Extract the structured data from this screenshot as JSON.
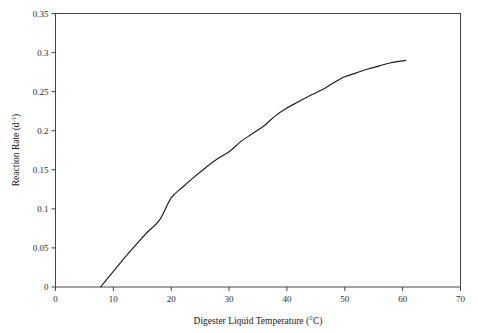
{
  "chart_data": {
    "type": "line",
    "title": "",
    "xlabel": "Digester Liquid Temperature (°C)",
    "ylabel": "Reaction Rate (d⁻¹)",
    "xlim": [
      0,
      70
    ],
    "ylim": [
      0,
      0.35
    ],
    "xticks": [
      0,
      10,
      20,
      30,
      40,
      50,
      60,
      70
    ],
    "xticklabels": [
      "0",
      "10",
      "20",
      "30",
      "40",
      "50",
      "60",
      "70"
    ],
    "yticks": [
      0,
      0.05,
      0.1,
      0.15,
      0.2,
      0.25,
      0.3,
      0.35
    ],
    "yticklabels": [
      "0",
      "0.05",
      "0.1",
      "0.15",
      "0.2",
      "0.25",
      "0.3",
      "0.35"
    ],
    "grid": false,
    "legend": false,
    "line_color": "#1d1d1d",
    "series": [
      {
        "name": "reaction-rate",
        "x": [
          7.8,
          9,
          10,
          12,
          14,
          16,
          18,
          20,
          22,
          24,
          26,
          28,
          30,
          32,
          34,
          36,
          38,
          40,
          42,
          44,
          46,
          48,
          50,
          52,
          54,
          56,
          58,
          60.5
        ],
        "y": [
          0.0,
          0.011,
          0.02,
          0.038,
          0.055,
          0.071,
          0.086,
          0.114,
          0.128,
          0.141,
          0.153,
          0.164,
          0.173,
          0.186,
          0.196,
          0.206,
          0.219,
          0.229,
          0.237,
          0.245,
          0.252,
          0.261,
          0.269,
          0.274,
          0.279,
          0.283,
          0.287,
          0.29
        ]
      }
    ]
  },
  "labels": {
    "y_axis_base": "Reaction Rate (d",
    "y_axis_exponent": "-1",
    "y_axis_close": ")"
  }
}
